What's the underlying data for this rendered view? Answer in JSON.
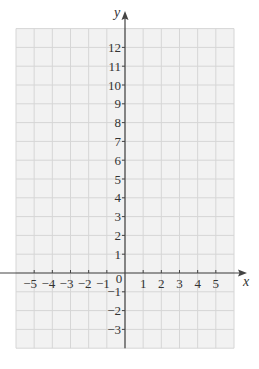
{
  "chart_data": {
    "type": "scatter",
    "title": "",
    "xlabel": "x",
    "ylabel": "y",
    "xlim": [
      -6,
      6
    ],
    "ylim": [
      -4,
      13
    ],
    "grid": true,
    "x_ticks": [
      -5,
      -4,
      -3,
      -2,
      -1,
      0,
      1,
      2,
      3,
      4,
      5
    ],
    "y_ticks": [
      -3,
      -2,
      -1,
      1,
      2,
      3,
      4,
      5,
      6,
      7,
      8,
      9,
      10,
      11,
      12
    ],
    "x_tick_labels": [
      "−5",
      "−4",
      "−3",
      "−2",
      "−1",
      "0",
      "1",
      "2",
      "3",
      "4",
      "5"
    ],
    "y_tick_labels": [
      "−3",
      "−2",
      "−1",
      "1",
      "2",
      "3",
      "4",
      "5",
      "6",
      "7",
      "8",
      "9",
      "10",
      "11",
      "12"
    ],
    "origin_label": "0",
    "series": [],
    "colors": {
      "grid_background": "#f2f2f2",
      "grid_line": "#d6d6d6",
      "axis": "#444444",
      "text": "#333333"
    }
  }
}
